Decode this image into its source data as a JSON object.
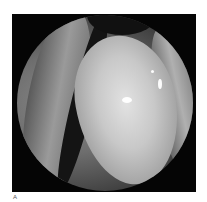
{
  "figure": {
    "panel_label": "A",
    "colors": {
      "frame": "#050505",
      "background": "#ffffff",
      "mass": "#c8c8c8"
    }
  }
}
